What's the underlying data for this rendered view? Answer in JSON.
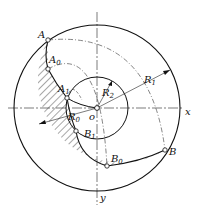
{
  "diagram": {
    "labels": {
      "A": "A",
      "A0": "A",
      "A0_sub": "0",
      "A1": "A",
      "A1_sub": "1",
      "B": "B",
      "B0": "B",
      "B0_sub": "0",
      "B1": "B",
      "B1_sub": "1",
      "R1": "R",
      "R1_sub": "1",
      "R2": "R",
      "R2_sub": "2",
      "R0": "R",
      "R0_sub": "0",
      "O": "o",
      "x": "x",
      "y": "y"
    },
    "colors": {
      "stroke": "#111111",
      "background": "#ffffff"
    }
  }
}
